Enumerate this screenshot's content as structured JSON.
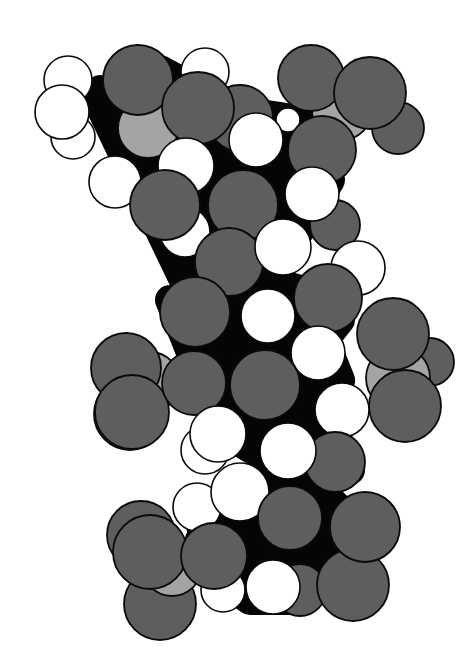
{
  "figure": {
    "kind": "space-filling molecular model",
    "width": 472,
    "height": 660,
    "background": "#ffffff",
    "palette": {
      "oxygen": "#5e5e5e",
      "hydrogen": "#ffffff",
      "carbon": "#050505",
      "phosphorus": "#a4a4a4",
      "outline": "#0a0a0a"
    },
    "backbone_blobs": [
      {
        "points": "95,95 160,70 215,100 240,150 300,150 330,180 300,230 250,230 230,270 300,290 340,320 300,370 250,380 220,430 270,460 330,430 350,470 300,500 240,500 200,540 230,590 280,600 330,570 370,540 330,500 280,480"
      },
      {
        "points": "100,90 150,120 180,180 240,190 300,170 330,140 300,120"
      },
      {
        "points": "170,300 230,330 290,320 320,330 340,380 300,420 250,430 210,400"
      },
      {
        "points": "200,520 260,510 300,540 330,560 300,600 250,600 210,570"
      }
    ],
    "atoms": [
      {
        "el": "hydrogen",
        "cx": 73,
        "cy": 137,
        "r": 22
      },
      {
        "el": "hydrogen",
        "cx": 68,
        "cy": 80,
        "r": 24
      },
      {
        "el": "hydrogen",
        "cx": 205,
        "cy": 72,
        "r": 24
      },
      {
        "el": "phosphorus",
        "cx": 148,
        "cy": 128,
        "r": 30
      },
      {
        "el": "oxygen",
        "cx": 138,
        "cy": 80,
        "r": 35
      },
      {
        "el": "hydrogen",
        "cx": 62,
        "cy": 112,
        "r": 27
      },
      {
        "el": "oxygen",
        "cx": 240,
        "cy": 118,
        "r": 33
      },
      {
        "el": "oxygen",
        "cx": 198,
        "cy": 108,
        "r": 36
      },
      {
        "el": "hydrogen",
        "cx": 115,
        "cy": 182,
        "r": 26
      },
      {
        "el": "oxygen",
        "cx": 398,
        "cy": 128,
        "r": 26
      },
      {
        "el": "phosphorus",
        "cx": 342,
        "cy": 110,
        "r": 30
      },
      {
        "el": "oxygen",
        "cx": 311,
        "cy": 78,
        "r": 33
      },
      {
        "el": "oxygen",
        "cx": 370,
        "cy": 93,
        "r": 36
      },
      {
        "el": "hydrogen",
        "cx": 288,
        "cy": 120,
        "r": 12
      },
      {
        "el": "hydrogen",
        "cx": 256,
        "cy": 140,
        "r": 27
      },
      {
        "el": "oxygen",
        "cx": 322,
        "cy": 150,
        "r": 34
      },
      {
        "el": "hydrogen",
        "cx": 185,
        "cy": 232,
        "r": 25
      },
      {
        "el": "oxygen",
        "cx": 335,
        "cy": 225,
        "r": 25
      },
      {
        "el": "hydrogen",
        "cx": 186,
        "cy": 166,
        "r": 28
      },
      {
        "el": "oxygen",
        "cx": 165,
        "cy": 205,
        "r": 35
      },
      {
        "el": "oxygen",
        "cx": 243,
        "cy": 205,
        "r": 35
      },
      {
        "el": "hydrogen",
        "cx": 312,
        "cy": 194,
        "r": 27
      },
      {
        "el": "hydrogen",
        "cx": 358,
        "cy": 268,
        "r": 27
      },
      {
        "el": "oxygen",
        "cx": 229,
        "cy": 262,
        "r": 34
      },
      {
        "el": "hydrogen",
        "cx": 283,
        "cy": 247,
        "r": 28
      },
      {
        "el": "oxygen",
        "cx": 328,
        "cy": 298,
        "r": 34
      },
      {
        "el": "oxygen",
        "cx": 195,
        "cy": 312,
        "r": 35
      },
      {
        "el": "hydrogen",
        "cx": 268,
        "cy": 316,
        "r": 27
      },
      {
        "el": "oxygen",
        "cx": 430,
        "cy": 362,
        "r": 24
      },
      {
        "el": "phosphorus",
        "cx": 398,
        "cy": 378,
        "r": 32
      },
      {
        "el": "oxygen",
        "cx": 393,
        "cy": 334,
        "r": 36
      },
      {
        "el": "oxygen",
        "cx": 405,
        "cy": 406,
        "r": 36
      },
      {
        "el": "hydrogen",
        "cx": 318,
        "cy": 353,
        "r": 27
      },
      {
        "el": "oxygen",
        "cx": 130,
        "cy": 414,
        "r": 36
      },
      {
        "el": "phosphorus",
        "cx": 150,
        "cy": 382,
        "r": 30
      },
      {
        "el": "oxygen",
        "cx": 126,
        "cy": 368,
        "r": 35
      },
      {
        "el": "oxygen",
        "cx": 132,
        "cy": 412,
        "r": 37
      },
      {
        "el": "hydrogen",
        "cx": 205,
        "cy": 450,
        "r": 24
      },
      {
        "el": "oxygen",
        "cx": 194,
        "cy": 383,
        "r": 32
      },
      {
        "el": "oxygen",
        "cx": 265,
        "cy": 385,
        "r": 35
      },
      {
        "el": "hydrogen",
        "cx": 342,
        "cy": 410,
        "r": 27
      },
      {
        "el": "oxygen",
        "cx": 335,
        "cy": 462,
        "r": 30
      },
      {
        "el": "hydrogen",
        "cx": 218,
        "cy": 434,
        "r": 28
      },
      {
        "el": "hydrogen",
        "cx": 288,
        "cy": 451,
        "r": 28
      },
      {
        "el": "hydrogen",
        "cx": 197,
        "cy": 507,
        "r": 24
      },
      {
        "el": "hydrogen",
        "cx": 240,
        "cy": 492,
        "r": 29
      },
      {
        "el": "oxygen",
        "cx": 160,
        "cy": 604,
        "r": 36
      },
      {
        "el": "oxygen",
        "cx": 141,
        "cy": 535,
        "r": 34
      },
      {
        "el": "phosphorus",
        "cx": 172,
        "cy": 566,
        "r": 30
      },
      {
        "el": "oxygen",
        "cx": 150,
        "cy": 552,
        "r": 37
      },
      {
        "el": "hydrogen",
        "cx": 223,
        "cy": 590,
        "r": 22
      },
      {
        "el": "oxygen",
        "cx": 214,
        "cy": 556,
        "r": 33
      },
      {
        "el": "oxygen",
        "cx": 300,
        "cy": 590,
        "r": 26
      },
      {
        "el": "oxygen",
        "cx": 353,
        "cy": 585,
        "r": 36
      },
      {
        "el": "oxygen",
        "cx": 290,
        "cy": 518,
        "r": 32
      },
      {
        "el": "oxygen",
        "cx": 365,
        "cy": 527,
        "r": 35
      },
      {
        "el": "hydrogen",
        "cx": 273,
        "cy": 587,
        "r": 27
      }
    ]
  }
}
